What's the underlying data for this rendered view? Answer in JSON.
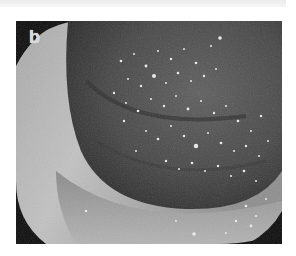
{
  "figure": {
    "panel_label": "b",
    "colors": {
      "background": "#ffffff",
      "frame_corner": "#0b0b0b",
      "wall_light": "#b8b8b8",
      "mucosa_dark": "#4a4a4a",
      "speckle": "#f0f0f0"
    }
  }
}
